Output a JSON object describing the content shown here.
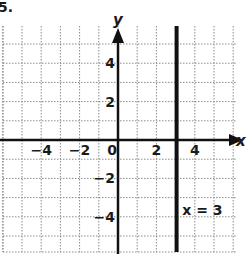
{
  "problem_number": "5.",
  "chart_data": {
    "type": "line",
    "title": "",
    "xlabel": "x",
    "ylabel": "y",
    "xlim": [
      -6,
      6
    ],
    "ylim": [
      -6,
      6
    ],
    "grid": true,
    "grid_style": "dotted",
    "x_ticks": [
      -4,
      -2,
      0,
      2,
      4
    ],
    "x_tick_labels": [
      "−4",
      "−2",
      "0",
      "2",
      "4"
    ],
    "y_ticks": [
      4,
      2,
      -2,
      -4
    ],
    "y_tick_labels": [
      "4",
      "2",
      "−2",
      "−4"
    ],
    "series": [
      {
        "name": "x = 3",
        "kind": "vertical_line",
        "x": 3,
        "points": [
          [
            3,
            -6
          ],
          [
            3,
            6
          ]
        ]
      }
    ],
    "annotations": [
      {
        "text": "x = 3",
        "x": 3.3,
        "y": -3.8
      }
    ],
    "colors": {
      "axis": "#111111",
      "grid": "#8a8a8a",
      "line": "#111111"
    }
  }
}
